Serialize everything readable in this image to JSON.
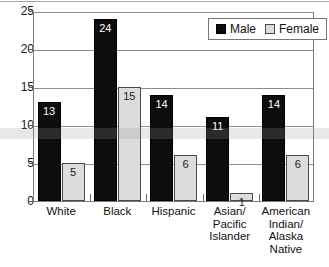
{
  "chart_data": {
    "type": "bar",
    "title": "",
    "subtitle": "",
    "xlabel": "",
    "ylabel": "",
    "ylim": [
      0,
      25
    ],
    "ytick_labels": [
      "0",
      "5",
      "10",
      "15",
      "20",
      "25"
    ],
    "ytick_values": [
      0,
      5,
      10,
      15,
      20,
      25
    ],
    "grid": true,
    "legend_position": "top-right-inside",
    "categories": [
      "White",
      "Black",
      "Hispanic",
      "Asian/\nPacific\nIslander",
      "American\nIndian/\nAlaska\nNative"
    ],
    "category_lines": [
      [
        "White"
      ],
      [
        "Black"
      ],
      [
        "Hispanic"
      ],
      [
        "Asian/",
        "Pacific",
        "Islander"
      ],
      [
        "American",
        "Indian/",
        "Alaska",
        "Native"
      ]
    ],
    "series": [
      {
        "name": "Male",
        "color": "#0d0d0d",
        "values": [
          13,
          24,
          14,
          11,
          14
        ],
        "labels": [
          "13",
          "24",
          "14",
          "11",
          "14"
        ]
      },
      {
        "name": "Female",
        "color": "#dcdcdc",
        "values": [
          5,
          15,
          6,
          1,
          6
        ],
        "labels": [
          "5",
          "15",
          "6",
          "1",
          "6"
        ]
      }
    ]
  },
  "legend": {
    "items": [
      {
        "label": "Male",
        "swatch": "male"
      },
      {
        "label": "Female",
        "swatch": "female"
      }
    ]
  },
  "colors": {
    "male": "#0d0d0d",
    "female": "#dcdcdc",
    "axis": "#7a7a7a",
    "grid": "#8c8c8c",
    "text": "#111111"
  }
}
